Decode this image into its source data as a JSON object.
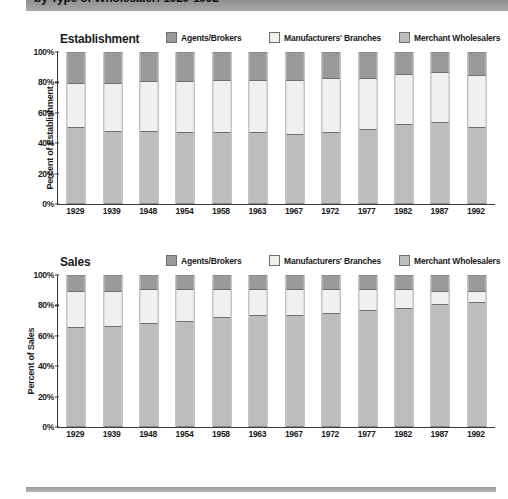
{
  "page": {
    "title_bar_text": "by Type of Wholesaler: 1929-1992",
    "footer_rule": "horizontal-rule"
  },
  "legend": {
    "items": [
      {
        "label": "Agents/Brokers",
        "color": "#9a9a9a",
        "key": "agents"
      },
      {
        "label": "Manufacturers' Branches",
        "color": "#f0f0ee",
        "key": "branches"
      },
      {
        "label": "Merchant Wholesalers",
        "color": "#bdbdbd",
        "key": "merchant"
      }
    ]
  },
  "chart_data": [
    {
      "type": "bar",
      "stacked": true,
      "title": "Establishment",
      "xlabel": "",
      "ylabel": "Percent of Establishment",
      "ylim": [
        0,
        100
      ],
      "yticks": [
        "0%",
        "20%",
        "40%",
        "60%",
        "80%",
        "100%"
      ],
      "ytick_values": [
        0,
        20,
        40,
        60,
        80,
        100
      ],
      "grid": false,
      "legend_position": "top-right",
      "categories": [
        "1929",
        "1939",
        "1948",
        "1954",
        "1958",
        "1963",
        "1967",
        "1972",
        "1977",
        "1982",
        "1987",
        "1992"
      ],
      "series": [
        {
          "name": "Merchant Wholesalers",
          "key": "merchant",
          "values": [
            51,
            48,
            48,
            47,
            47,
            47,
            46,
            47,
            49,
            53,
            54,
            51
          ]
        },
        {
          "name": "Manufacturers' Branches",
          "key": "branches",
          "values": [
            29,
            32,
            33,
            34,
            35,
            35,
            36,
            36,
            34,
            33,
            33,
            34
          ]
        },
        {
          "name": "Agents/Brokers",
          "key": "agents",
          "values": [
            20,
            20,
            19,
            19,
            18,
            18,
            18,
            17,
            17,
            14,
            13,
            15
          ]
        }
      ]
    },
    {
      "type": "bar",
      "stacked": true,
      "title": "Sales",
      "xlabel": "",
      "ylabel": "Percent of Sales",
      "ylim": [
        0,
        100
      ],
      "yticks": [
        "0%",
        "20%",
        "40%",
        "60%",
        "80%",
        "100%"
      ],
      "ytick_values": [
        0,
        20,
        40,
        60,
        80,
        100
      ],
      "grid": false,
      "legend_position": "top-right",
      "categories": [
        "1929",
        "1939",
        "1948",
        "1954",
        "1958",
        "1963",
        "1967",
        "1972",
        "1977",
        "1982",
        "1987",
        "1992"
      ],
      "series": [
        {
          "name": "Merchant Wholesalers",
          "key": "merchant",
          "values": [
            66,
            67,
            69,
            70,
            73,
            74,
            74,
            76,
            78,
            79,
            82,
            83
          ]
        },
        {
          "name": "Manufacturers' Branches",
          "key": "branches",
          "values": [
            24,
            23,
            22,
            21,
            18,
            17,
            17,
            15,
            13,
            12,
            8,
            7
          ]
        },
        {
          "name": "Agents/Brokers",
          "key": "agents",
          "values": [
            10,
            10,
            9,
            9,
            9,
            9,
            9,
            9,
            9,
            9,
            10,
            10
          ]
        }
      ]
    }
  ]
}
